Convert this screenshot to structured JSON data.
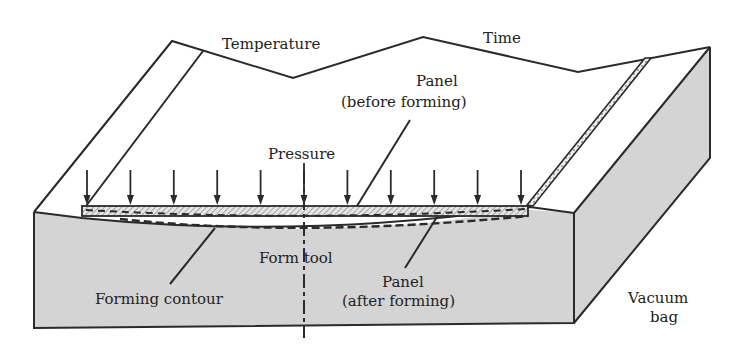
{
  "diagram": {
    "labels": {
      "temperature": "Temperature",
      "time": "Time",
      "panel_before_line1": "Panel",
      "panel_before_line2": "(before forming)",
      "pressure": "Pressure",
      "form_tool": "Form tool",
      "forming_contour": "Forming contour",
      "panel_after_line1": "Panel",
      "panel_after_line2": "(after forming)",
      "vacuum_bag_line1": "Vacuum",
      "vacuum_bag_line2": "bag"
    },
    "pressure_arrow_count": 11,
    "colors": {
      "tool_fill": "#d4d4d4",
      "line": "#2a2a2a",
      "background": "#ffffff"
    }
  }
}
